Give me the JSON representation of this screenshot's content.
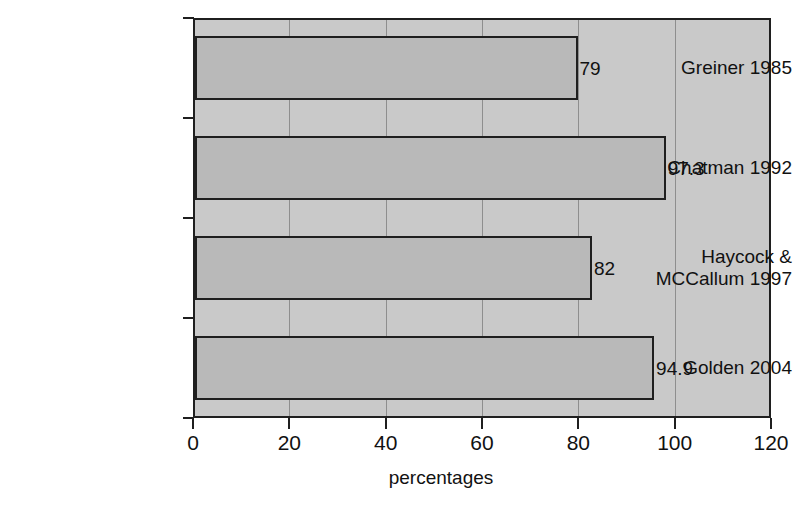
{
  "chart_data": {
    "type": "bar",
    "orientation": "horizontal",
    "title": "",
    "xlabel": "percentages",
    "ylabel": "",
    "xlim": [
      0,
      120
    ],
    "xticks": [
      0,
      20,
      40,
      60,
      80,
      100,
      120
    ],
    "grid": "vertical",
    "legend": "none",
    "categories": [
      "Greiner 1985",
      "Chatman 1992",
      "Haycock &\nMCCallum 1997",
      "Golden 2004"
    ],
    "values": [
      79,
      97.3,
      82,
      94.9
    ],
    "value_labels": [
      "79",
      "97.3",
      "82",
      "94.9"
    ],
    "colors": {
      "bar_fill": "#b9b9b9",
      "bar_border": "#1f1f1f",
      "plot_background": "#c9c9c9",
      "gridline": "#8e8e8e",
      "text": "#111111",
      "page_background": "#ffffff"
    }
  },
  "axis": {
    "x_tick_labels": [
      "0",
      "20",
      "40",
      "60",
      "80",
      "100",
      "120"
    ],
    "x_title": "percentages"
  }
}
